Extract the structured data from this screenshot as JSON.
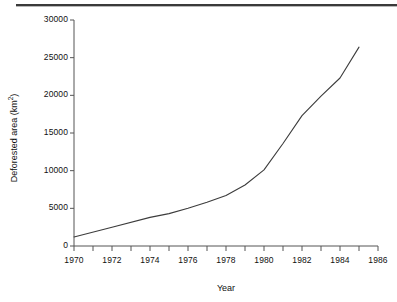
{
  "chart_data": {
    "type": "line",
    "title": "",
    "xlabel": "Year",
    "ylabel": "Deforested area (km2)",
    "ylabel_base": "Deforested area (km",
    "ylabel_sup": "2",
    "ylabel_tail": ")",
    "xlim": [
      1970,
      1986
    ],
    "ylim": [
      0,
      30000
    ],
    "grid": false,
    "legend": false,
    "line_color": "#3c3c3c",
    "x_major_ticks": [
      1970,
      1972,
      1974,
      1976,
      1978,
      1980,
      1982,
      1984,
      1986
    ],
    "x_major_tick_labels": [
      "1970",
      "1972",
      "1974",
      "1976",
      "1978",
      "1980",
      "1982",
      "1984",
      "1986"
    ],
    "x_minor_ticks": [
      1971,
      1973,
      1975,
      1977,
      1979,
      1981,
      1983,
      1985
    ],
    "y_major_ticks": [
      0,
      5000,
      10000,
      15000,
      20000,
      25000,
      30000
    ],
    "y_major_tick_labels": [
      "0",
      "5000",
      "10000",
      "15000",
      "20000",
      "25000",
      "30000"
    ],
    "series": [
      {
        "name": "Deforested area",
        "x": [
          1970,
          1972,
          1974,
          1975,
          1976,
          1977,
          1978,
          1979,
          1980,
          1981,
          1982,
          1983,
          1984,
          1985
        ],
        "values": [
          1200,
          2500,
          3800,
          4300,
          5000,
          5800,
          6700,
          8100,
          10100,
          13600,
          17300,
          19900,
          22300,
          26400
        ]
      }
    ]
  },
  "top_rule": {
    "present": true
  }
}
